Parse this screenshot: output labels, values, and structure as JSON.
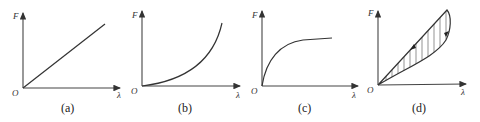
{
  "panels": [
    {
      "id": "a",
      "caption": "(a)",
      "y_label": "F",
      "x_label": "λ",
      "origin_label": "O",
      "curve": "linear"
    },
    {
      "id": "b",
      "caption": "(b)",
      "y_label": "F",
      "x_label": "λ",
      "origin_label": "O",
      "curve": "convex (stiffening)"
    },
    {
      "id": "c",
      "caption": "(c)",
      "y_label": "F",
      "x_label": "λ",
      "origin_label": "O",
      "curve": "concave (saturating)"
    },
    {
      "id": "d",
      "caption": "(d)",
      "y_label": "F",
      "x_label": "λ",
      "origin_label": "O",
      "curve": "hysteresis loop (hatched)"
    }
  ],
  "colors": {
    "line": "#333333",
    "background": "#ffffff"
  }
}
